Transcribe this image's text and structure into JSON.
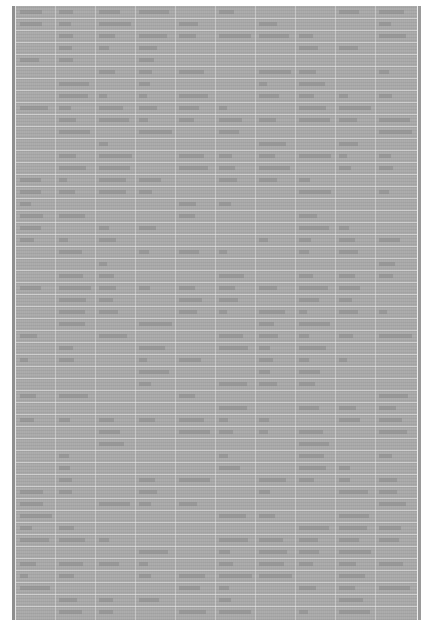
{
  "document": {
    "type": "scanned-ledger-page",
    "legible_text": "",
    "colors": {
      "background": "#ffffff",
      "page_gray": "#a9a9a9",
      "grid_line": "#ebebeb"
    },
    "grid": {
      "row_count": 51,
      "row_spacing_px": 12,
      "column_lines_x": [
        43,
        83,
        123,
        163,
        203,
        243,
        283,
        323,
        363
      ]
    }
  }
}
